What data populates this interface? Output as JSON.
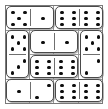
{
  "app": {
    "title": "Domino Grid Puzzle",
    "description": "A 4 by 4 arrangement of domino halves forming eight dominoes"
  },
  "colors": {
    "background": "#ffffff",
    "pip": "#0d0d0d",
    "tile_border": "#4a4a4a",
    "grid_line": "#9a9a9a",
    "frame": "#7a7a7a"
  },
  "board": {
    "rows": 4,
    "columns": 4,
    "cell_values": [
      [
        5,
        1,
        6,
        6
      ],
      [
        5,
        1,
        1,
        5
      ],
      [
        3,
        6,
        6,
        2
      ],
      [
        1,
        2,
        6,
        6
      ]
    ]
  },
  "chart_data": {
    "type": "table",
    "title": "Domino Grid Puzzle",
    "categories": [
      "col-1",
      "col-2",
      "col-3",
      "col-4"
    ],
    "rows": [
      "row-1",
      "row-2",
      "row-3",
      "row-4"
    ],
    "values": [
      [
        5,
        1,
        6,
        6
      ],
      [
        5,
        1,
        1,
        5
      ],
      [
        3,
        6,
        6,
        2
      ],
      [
        1,
        2,
        6,
        6
      ]
    ],
    "grid": true,
    "legend": "none"
  },
  "dominoes": [
    {
      "id": "domino-1",
      "orientation": "horizontal",
      "values": [
        5,
        1
      ],
      "label": "5-1"
    },
    {
      "id": "domino-2",
      "orientation": "horizontal",
      "values": [
        6,
        6
      ],
      "label": "6-6"
    },
    {
      "id": "domino-3",
      "orientation": "vertical",
      "values": [
        5,
        3
      ],
      "label": "5-3"
    },
    {
      "id": "domino-4",
      "orientation": "horizontal",
      "values": [
        1,
        1
      ],
      "label": "1-1"
    },
    {
      "id": "domino-5",
      "orientation": "vertical",
      "values": [
        5,
        2
      ],
      "label": "5-2"
    },
    {
      "id": "domino-6",
      "orientation": "horizontal",
      "values": [
        6,
        6
      ],
      "label": "6-6"
    },
    {
      "id": "domino-7",
      "orientation": "horizontal",
      "values": [
        1,
        2
      ],
      "label": "1-2"
    },
    {
      "id": "domino-8",
      "orientation": "horizontal",
      "values": [
        6,
        6
      ],
      "label": "6-6"
    }
  ]
}
